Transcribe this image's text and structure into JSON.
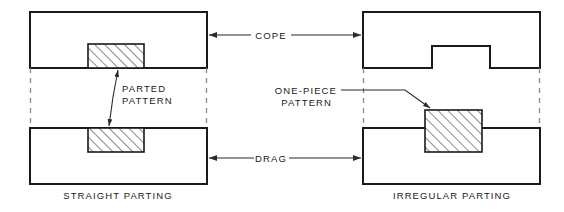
{
  "figure": {
    "type": "engineering-diagram",
    "background_color": "#ffffff",
    "line_color": "#1a1a1a",
    "parting_line_color": "#8a8a8a"
  },
  "labels": {
    "cope": "COPE",
    "drag": "DRAG",
    "parted_pattern_line1": "PARTED",
    "parted_pattern_line2": "PATTERN",
    "one_piece_pattern_line1": "ONE-PIECE",
    "one_piece_pattern_line2": "PATTERN"
  },
  "captions": {
    "left": "STRAIGHT PARTING",
    "right": "IRREGULAR PARTING"
  },
  "left_assembly": {
    "name": "straight-parting-assembly",
    "cope": {
      "x": 30,
      "y": 12,
      "width": 177,
      "height": 56
    },
    "drag": {
      "x": 30,
      "y": 128,
      "width": 177,
      "height": 56
    },
    "cope_pattern_half": {
      "x": 88,
      "y": 44,
      "width": 56,
      "height": 24
    },
    "drag_pattern_half": {
      "x": 88,
      "y": 128,
      "width": 56,
      "height": 24
    },
    "parting_line_left_x": 30,
    "parting_line_right_x": 207,
    "parting_line_top_y": 68,
    "parting_line_bottom_y": 128
  },
  "right_assembly": {
    "name": "irregular-parting-assembly",
    "cope": {
      "x": 363,
      "y": 12,
      "width": 177,
      "height": 56
    },
    "drag": {
      "x": 363,
      "y": 128,
      "width": 177,
      "height": 56
    },
    "cope_notch": {
      "x": 432,
      "y": 46,
      "width": 58,
      "height": 22
    },
    "drag_pattern_full": {
      "x": 425,
      "y": 110,
      "width": 57,
      "height": 42
    },
    "parting_line_left_x": 363,
    "parting_line_right_x": 540,
    "parting_line_top_y": 68,
    "parting_line_bottom_y": 128
  },
  "annotations": {
    "cope_dim": {
      "left_arrow_x": 207,
      "right_arrow_x": 363,
      "y": 35
    },
    "drag_dim": {
      "left_arrow_x": 207,
      "right_arrow_x": 363,
      "y": 158
    }
  }
}
